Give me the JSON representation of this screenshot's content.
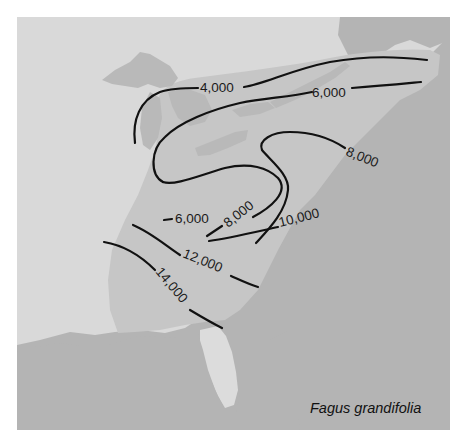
{
  "map": {
    "species_label": "Fagus grandifolia",
    "colors": {
      "background": "#ffffff",
      "land": "#d9d9d9",
      "range": "#c6c6c6",
      "water": "#b4b4b4",
      "lakes": "#b9b9b9",
      "florida": "#dcdcdc",
      "contour": "#111111"
    },
    "contours": [
      {
        "value": 4000,
        "label": "4,000"
      },
      {
        "value": 6000,
        "label": "6,000"
      },
      {
        "value": 6000,
        "label": "6,000"
      },
      {
        "value": 8000,
        "label": "8,000"
      },
      {
        "value": 8000,
        "label": "8,000"
      },
      {
        "value": 10000,
        "label": "10,000"
      },
      {
        "value": 12000,
        "label": "12,000"
      },
      {
        "value": 14000,
        "label": "14,000"
      }
    ]
  }
}
